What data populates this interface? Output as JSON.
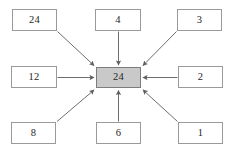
{
  "diagram": {
    "center": {
      "id": "center",
      "label": "24",
      "fill": "#c9c9c9",
      "border": "#7d7d7d"
    },
    "nodes": [
      {
        "id": "top-left",
        "label": "24",
        "x": 12,
        "y": 9,
        "w": 45,
        "h": 22
      },
      {
        "id": "top-center",
        "label": "4",
        "x": 95,
        "y": 9,
        "w": 46,
        "h": 22
      },
      {
        "id": "top-right",
        "label": "3",
        "x": 177,
        "y": 9,
        "w": 45,
        "h": 22
      },
      {
        "id": "middle-left",
        "label": "12",
        "x": 11,
        "y": 66,
        "w": 46,
        "h": 22
      },
      {
        "id": "middle-right",
        "label": "2",
        "x": 178,
        "y": 66,
        "w": 45,
        "h": 22
      },
      {
        "id": "bottom-left",
        "label": "8",
        "x": 11,
        "y": 122,
        "w": 45,
        "h": 22
      },
      {
        "id": "bottom-center",
        "label": "6",
        "x": 96,
        "y": 122,
        "w": 45,
        "h": 22
      },
      {
        "id": "bottom-right",
        "label": "1",
        "x": 178,
        "y": 122,
        "w": 45,
        "h": 22
      }
    ],
    "center_box": {
      "x": 96,
      "y": 67,
      "w": 45,
      "h": 21
    },
    "arrows": [
      {
        "id": "arrow-top-left-to-center",
        "from": "top-left",
        "x1": 57.5,
        "y1": 31.5,
        "x2": 94,
        "y2": 65.5
      },
      {
        "id": "arrow-top-center-to-center",
        "from": "top-center",
        "x1": 118.5,
        "y1": 31.5,
        "x2": 118.5,
        "y2": 65
      },
      {
        "id": "arrow-top-right-to-center",
        "from": "top-right",
        "x1": 176.5,
        "y1": 31.5,
        "x2": 143,
        "y2": 65.5
      },
      {
        "id": "arrow-middle-left-to-center",
        "from": "middle-left",
        "x1": 57.5,
        "y1": 77.5,
        "x2": 94,
        "y2": 77.5
      },
      {
        "id": "arrow-middle-right-to-center",
        "from": "middle-right",
        "x1": 177.5,
        "y1": 77.5,
        "x2": 143,
        "y2": 77.5
      },
      {
        "id": "arrow-bottom-left-to-center",
        "from": "bottom-left",
        "x1": 57,
        "y1": 121.5,
        "x2": 94,
        "y2": 90
      },
      {
        "id": "arrow-bottom-center-to-center",
        "from": "bottom-center",
        "x1": 118.5,
        "y1": 121.5,
        "x2": 118.5,
        "y2": 90.5
      },
      {
        "id": "arrow-bottom-right-to-center",
        "from": "bottom-right",
        "x1": 177.5,
        "y1": 121.5,
        "x2": 143,
        "y2": 90
      }
    ],
    "style": {
      "arrow_color": "#6e6e6e",
      "arrow_width": 1,
      "node_border": "#9a9a9a",
      "node_fill": "#ffffff",
      "text_color": "#262626",
      "background": "#ffffff"
    }
  }
}
